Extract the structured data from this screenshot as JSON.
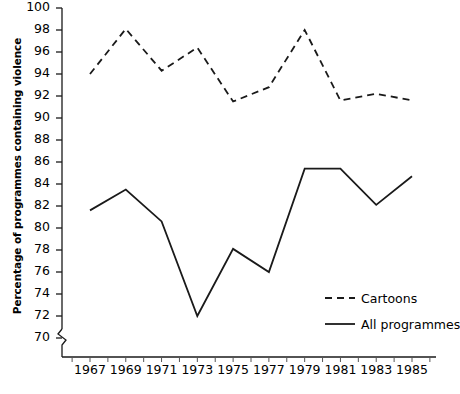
{
  "chart_data": {
    "type": "line",
    "title": "",
    "xlabel": "",
    "ylabel": "Percentage of programmes containing violence",
    "x": [
      1967,
      1968,
      1969,
      1970,
      1971,
      1972,
      1973,
      1974,
      1975,
      1976,
      1977,
      1978,
      1979,
      1980,
      1981,
      1982,
      1983,
      1984,
      1985
    ],
    "xlim": [
      1966,
      1986
    ],
    "ylim": [
      70,
      100
    ],
    "ytick_labels": [
      "70",
      "72",
      "74",
      "76",
      "78",
      "80",
      "82",
      "84",
      "86",
      "88",
      "90",
      "92",
      "94",
      "96",
      "98",
      "100"
    ],
    "ytick_values": [
      70,
      72,
      74,
      76,
      78,
      80,
      82,
      84,
      86,
      88,
      90,
      92,
      94,
      96,
      98,
      100
    ],
    "xtick_labels": [
      "1967",
      "1969",
      "1971",
      "1973",
      "1975",
      "1977",
      "1979",
      "1981",
      "1983",
      "1985"
    ],
    "xtick_values": [
      1967,
      1969,
      1971,
      1973,
      1975,
      1977,
      1979,
      1981,
      1983,
      1985
    ],
    "y_axis_break": true,
    "grid": false,
    "legend_position": "bottom-right",
    "series": [
      {
        "name": "Cartoons",
        "style": "dashed",
        "color": "#1a1a1a",
        "x": [
          1967,
          1969,
          1971,
          1973,
          1975,
          1977,
          1979,
          1981,
          1983,
          1985
        ],
        "values": [
          94.0,
          98.1,
          94.3,
          96.4,
          91.5,
          92.8,
          98.0,
          91.6,
          92.2,
          91.6
        ]
      },
      {
        "name": "All programmes",
        "style": "solid",
        "color": "#1a1a1a",
        "x": [
          1967,
          1969,
          1971,
          1973,
          1975,
          1977,
          1979,
          1981,
          1983,
          1985
        ],
        "values": [
          81.6,
          83.5,
          80.6,
          72.0,
          78.1,
          76.0,
          85.4,
          85.4,
          82.1,
          84.7
        ]
      }
    ],
    "series_points": {
      "cartoons": [
        {
          "year": 1967,
          "value": 94.0
        },
        {
          "year": 1969,
          "value": 98.1
        },
        {
          "year": 1971,
          "value": 94.3
        },
        {
          "year": 1973,
          "value": 96.4
        },
        {
          "year": 1975,
          "value": 91.5
        },
        {
          "year": 1977,
          "value": 92.8
        },
        {
          "year": 1979,
          "value": 98.0
        },
        {
          "year": 1981,
          "value": 91.6
        },
        {
          "year": 1983,
          "value": 92.2
        },
        {
          "year": 1985,
          "value": 91.6
        }
      ],
      "all_programmes": [
        {
          "year": 1967,
          "value": 81.6
        },
        {
          "year": 1969,
          "value": 83.5
        },
        {
          "year": 1971,
          "value": 80.6
        },
        {
          "year": 1973,
          "value": 72.0
        },
        {
          "year": 1975,
          "value": 78.1
        },
        {
          "year": 1977,
          "value": 76.0
        },
        {
          "year": 1979,
          "value": 85.4
        },
        {
          "year": 1981,
          "value": 85.4
        },
        {
          "year": 1983,
          "value": 82.1
        },
        {
          "year": 1985,
          "value": 84.7
        }
      ]
    }
  },
  "legend": {
    "items": [
      {
        "label": "Cartoons",
        "style": "dashed"
      },
      {
        "label": "All programmes",
        "style": "solid"
      }
    ]
  },
  "axis": {
    "y_title": "Percentage of programmes containing violence"
  }
}
